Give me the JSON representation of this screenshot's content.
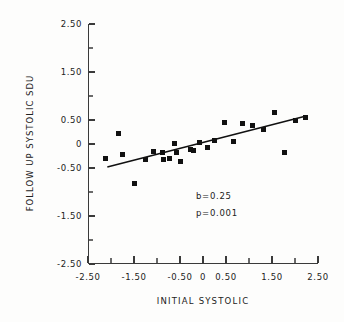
{
  "chart_data": {
    "type": "scatter",
    "title": "",
    "xlabel": "INITIAL SYSTOLIC",
    "ylabel": "FOLLOW UP SYSTOLIC SDU",
    "xlim": [
      -2.5,
      2.5
    ],
    "ylim": [
      -2.5,
      2.5
    ],
    "grid": false,
    "legend": null,
    "xticks": [
      {
        "value": -2.5,
        "label": "-2.50",
        "major": true
      },
      {
        "value": -2.0,
        "label": "",
        "major": false
      },
      {
        "value": -1.5,
        "label": "-1.50",
        "major": true
      },
      {
        "value": -1.0,
        "label": "",
        "major": false
      },
      {
        "value": -0.5,
        "label": "-0.50",
        "major": true
      },
      {
        "value": 0.0,
        "label": "0",
        "major": true
      },
      {
        "value": 0.5,
        "label": "0.50",
        "major": true
      },
      {
        "value": 1.0,
        "label": "",
        "major": false
      },
      {
        "value": 1.5,
        "label": "1.50",
        "major": true
      },
      {
        "value": 2.0,
        "label": "",
        "major": false
      },
      {
        "value": 2.5,
        "label": "2.50",
        "major": true
      }
    ],
    "yticks": [
      {
        "value": 2.5,
        "label": "2.50",
        "major": true
      },
      {
        "value": 2.0,
        "label": "",
        "major": false
      },
      {
        "value": 1.5,
        "label": "1.50",
        "major": true
      },
      {
        "value": 1.0,
        "label": "",
        "major": false
      },
      {
        "value": 0.5,
        "label": "0.50",
        "major": true
      },
      {
        "value": 0.0,
        "label": "0",
        "major": true
      },
      {
        "value": -0.5,
        "label": "-0.50",
        "major": true
      },
      {
        "value": -1.0,
        "label": "",
        "major": false
      },
      {
        "value": -1.5,
        "label": "-1.50",
        "major": true
      },
      {
        "value": -2.0,
        "label": "",
        "major": false
      },
      {
        "value": -2.5,
        "label": "-2.50",
        "major": true
      }
    ],
    "points": [
      {
        "x": -2.13,
        "y": -0.3
      },
      {
        "x": -1.83,
        "y": 0.22
      },
      {
        "x": -1.74,
        "y": -0.21
      },
      {
        "x": -1.5,
        "y": -0.83
      },
      {
        "x": -1.26,
        "y": -0.33
      },
      {
        "x": -1.08,
        "y": -0.16
      },
      {
        "x": -0.89,
        "y": -0.18
      },
      {
        "x": -0.85,
        "y": -0.32
      },
      {
        "x": -0.72,
        "y": -0.31
      },
      {
        "x": -0.62,
        "y": 0.02
      },
      {
        "x": -0.57,
        "y": -0.17
      },
      {
        "x": -0.48,
        "y": -0.36
      },
      {
        "x": -0.28,
        "y": -0.11
      },
      {
        "x": -0.21,
        "y": -0.14
      },
      {
        "x": -0.07,
        "y": 0.04
      },
      {
        "x": 0.1,
        "y": -0.07
      },
      {
        "x": 0.26,
        "y": 0.07
      },
      {
        "x": 0.46,
        "y": 0.45
      },
      {
        "x": 0.66,
        "y": 0.06
      },
      {
        "x": 0.86,
        "y": 0.42
      },
      {
        "x": 1.08,
        "y": 0.39
      },
      {
        "x": 1.32,
        "y": 0.31
      },
      {
        "x": 1.56,
        "y": 0.65
      },
      {
        "x": 1.78,
        "y": -0.17
      },
      {
        "x": 2.0,
        "y": 0.49
      },
      {
        "x": 2.22,
        "y": 0.56
      }
    ],
    "fit_line": {
      "slope": 0.25,
      "x_start": -2.08,
      "y_start": -0.48,
      "x_end": 2.22,
      "y_end": 0.58
    },
    "annotations": [
      {
        "text": "b=0.25"
      },
      {
        "text": "p=0.001"
      }
    ]
  }
}
